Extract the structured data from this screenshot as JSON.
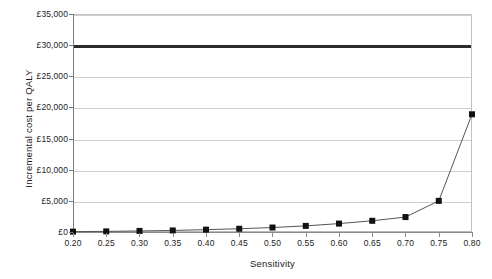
{
  "chart_data": {
    "type": "line",
    "title": "",
    "xlabel": "Sensitivity",
    "ylabel": "Incremental cost per QALY",
    "x": [
      0.2,
      0.25,
      0.3,
      0.35,
      0.4,
      0.45,
      0.5,
      0.55,
      0.6,
      0.65,
      0.7,
      0.75,
      0.8
    ],
    "values": [
      60,
      100,
      170,
      250,
      380,
      520,
      720,
      980,
      1350,
      1800,
      2400,
      5000,
      18900
    ],
    "xtick_labels": [
      "0.20",
      "0.25",
      "0.30",
      "0.35",
      "0.40",
      "0.45",
      "0.50",
      "0.55",
      "0.60",
      "0.65",
      "0.70",
      "0.75",
      "0.80"
    ],
    "ytick_labels": [
      "£35,000",
      "£30,000",
      "£25,000",
      "£20,000",
      "£15,000",
      "£10,000",
      "£5,000",
      "£0"
    ],
    "ytick_values": [
      35000,
      30000,
      25000,
      20000,
      15000,
      10000,
      5000,
      0
    ],
    "xlim": [
      0.2,
      0.8
    ],
    "ylim": [
      0,
      35000
    ],
    "grid": "horizontal",
    "legend": "none",
    "series_name": "Incremental cost per QALY",
    "annotations": [
      {
        "name": "willingness-to-pay-threshold",
        "value": 30000,
        "label": "£30,000 threshold",
        "style": "thick-horizontal-line",
        "color": "#2b2b2b"
      }
    ],
    "colors": {
      "marker": "#111111",
      "line": "#555555",
      "gridline": "#cfcfcf",
      "axis": "#7a7a7a",
      "threshold": "#2b2b2b",
      "background": "#ffffff"
    }
  }
}
